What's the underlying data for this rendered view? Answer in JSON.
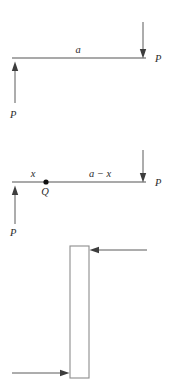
{
  "diagram": {
    "colors": {
      "beam": "#8d8d8d",
      "arrow_shaft": "#5a5a5a",
      "arrow_head": "#3d3d3d",
      "node_dot": "#111111",
      "label_text": "#2b2b2b",
      "background": "#ffffff"
    },
    "figures": [
      {
        "id": "figure-top",
        "name": "beam-with-end-forces",
        "beam": {
          "x1": 12,
          "y1": 58,
          "x2": 146,
          "y2": 58
        },
        "labels": [
          {
            "name": "span-label-a",
            "text": "a",
            "x": 78,
            "y": 53
          },
          {
            "name": "force-label-p-right",
            "text": "P",
            "x": 155,
            "y": 62
          },
          {
            "name": "force-label-p-left",
            "text": "P",
            "x": 10,
            "y": 118
          }
        ],
        "forces": [
          {
            "name": "force-down-right",
            "direction": "down",
            "x": 143,
            "from_y": 22,
            "to_y": 57,
            "magnitude_label": "P"
          },
          {
            "name": "force-up-left",
            "direction": "up",
            "x": 15,
            "from_y": 103,
            "to_y": 62,
            "magnitude_label": "P"
          }
        ]
      },
      {
        "id": "figure-middle",
        "name": "beam-with-section-point-q",
        "beam": {
          "x1": 12,
          "y1": 182,
          "x2": 146,
          "y2": 182
        },
        "node": {
          "name": "point-q-dot",
          "cx": 46,
          "cy": 182,
          "r": 2.6
        },
        "labels": [
          {
            "name": "segment-label-x",
            "text": "x",
            "x": 33,
            "y": 177
          },
          {
            "name": "point-label-q",
            "text": "Q",
            "x": 42,
            "y": 194
          },
          {
            "name": "segment-label-a-minus-x",
            "text": "a − x",
            "x": 88,
            "y": 177
          },
          {
            "name": "force-label-p-right",
            "text": "P",
            "x": 155,
            "y": 186
          },
          {
            "name": "force-label-p-left",
            "text": "P",
            "x": 10,
            "y": 236
          }
        ],
        "forces": [
          {
            "name": "force-down-right",
            "direction": "down",
            "x": 143,
            "from_y": 150,
            "to_y": 181,
            "magnitude_label": "P"
          },
          {
            "name": "force-up-left",
            "direction": "up",
            "x": 15,
            "from_y": 224,
            "to_y": 186,
            "magnitude_label": "P"
          }
        ]
      },
      {
        "id": "figure-bottom",
        "name": "vertical-bar-with-shear-couple",
        "bar": {
          "x": 70,
          "y": 246,
          "width": 19,
          "height": 132
        },
        "forces": [
          {
            "name": "force-left-top",
            "direction": "left",
            "y": 250,
            "from_x": 147,
            "to_x": 90
          },
          {
            "name": "force-right-bottom",
            "direction": "right",
            "y": 373,
            "from_x": 12,
            "to_x": 69
          }
        ],
        "labels": []
      }
    ]
  }
}
